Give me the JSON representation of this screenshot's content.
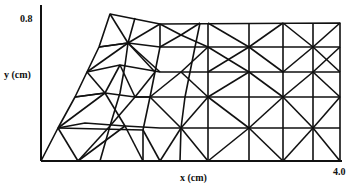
{
  "figure": {
    "type": "finite-element-mesh",
    "y_axis": {
      "label": "y (cm)",
      "tick_label": "0.8"
    },
    "x_axis": {
      "label": "x (cm)",
      "tick_label": "4.0"
    },
    "line_color": "#111111",
    "background": "#ffffff"
  }
}
